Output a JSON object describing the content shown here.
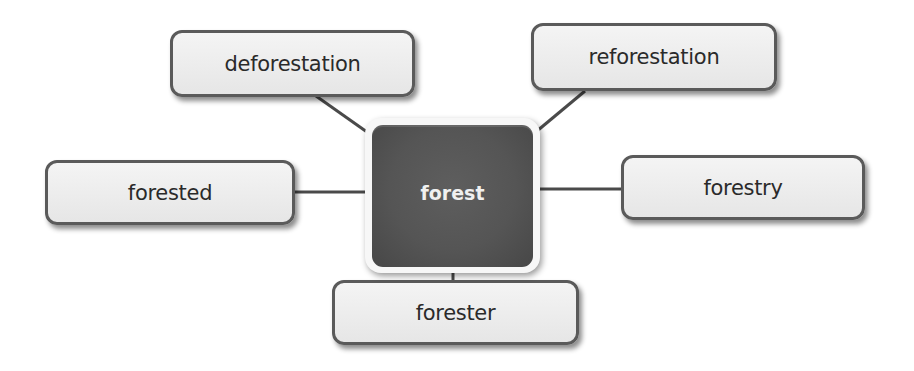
{
  "diagram": {
    "type": "word-web",
    "center": {
      "label": "forest"
    },
    "nodes": [
      {
        "id": "deforestation",
        "label": "deforestation",
        "position": "top-left"
      },
      {
        "id": "reforestation",
        "label": "reforestation",
        "position": "top-right"
      },
      {
        "id": "forested",
        "label": "forested",
        "position": "left"
      },
      {
        "id": "forestry",
        "label": "forestry",
        "position": "right"
      },
      {
        "id": "forester",
        "label": "forester",
        "position": "bottom"
      }
    ],
    "colors": {
      "center_fill": "#555555",
      "center_text": "#f0f0f0",
      "node_fill": "#ececec",
      "node_border": "#5a5a5a",
      "connector": "#4a4a4a",
      "node_text": "#2a2a2a"
    }
  }
}
